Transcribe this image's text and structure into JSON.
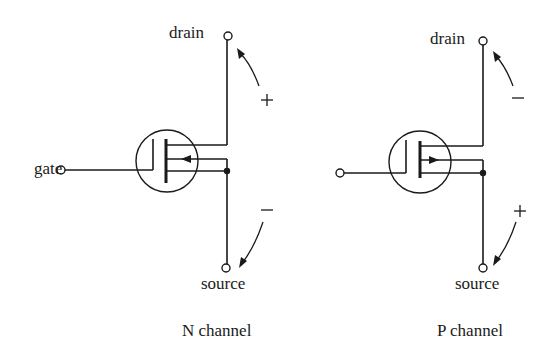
{
  "diagram": {
    "n_channel": {
      "caption": "N channel",
      "labels": {
        "drain": "drain",
        "gate": "gate",
        "source": "source"
      },
      "drain_polarity": "+",
      "source_polarity": "−",
      "substrate_arrow_direction": "inward (pointing toward channel)"
    },
    "p_channel": {
      "caption": "P channel",
      "labels": {
        "drain": "drain",
        "gate": "",
        "source": "source"
      },
      "drain_polarity": "−",
      "source_polarity": "+",
      "substrate_arrow_direction": "outward (pointing away from channel)"
    },
    "colors": {
      "ink": "#1a1a1a",
      "background": "#ffffff"
    }
  }
}
